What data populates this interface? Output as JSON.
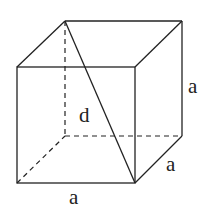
{
  "diagram": {
    "labels": {
      "diagonal": "d",
      "height": "a",
      "depth": "a",
      "width": "a"
    },
    "stroke_color": "#222222",
    "background": "#ffffff"
  }
}
